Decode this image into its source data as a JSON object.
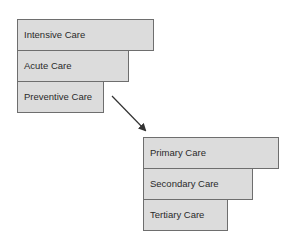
{
  "diagram": {
    "colors": {
      "box_fill": "#dcdcdc",
      "box_border": "#6e6e6e",
      "text": "#2a2a2a",
      "arrow": "#333333"
    },
    "group_top": {
      "items": [
        {
          "label": "Intensive Care"
        },
        {
          "label": "Acute Care"
        },
        {
          "label": "Preventive Care"
        }
      ]
    },
    "arrow": {
      "direction": "down-right",
      "from": "Preventive Care",
      "to": "Primary Care"
    },
    "group_bottom": {
      "items": [
        {
          "label": "Primary Care"
        },
        {
          "label": "Secondary Care"
        },
        {
          "label": "Tertiary Care"
        }
      ]
    }
  }
}
